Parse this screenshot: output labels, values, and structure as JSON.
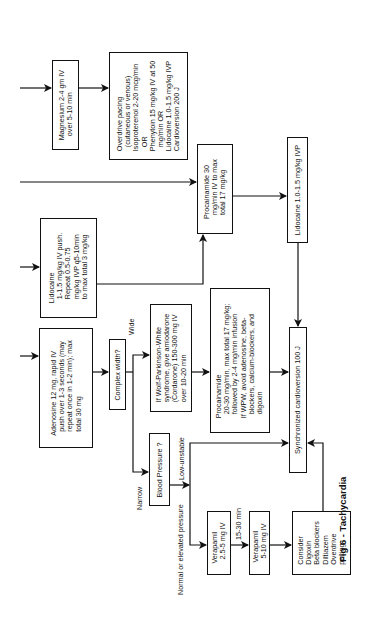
{
  "figure": {
    "caption": "Fig 6 - Tachycardia",
    "orientation": "rotated-90-ccw"
  },
  "nodes": {
    "magnesium": {
      "text": "Magnesium 2-4 gm IV\n  over 5-10 min"
    },
    "overdrive": {
      "text": "Overdrive pacing\n  (cutaneous or venous)\nIsoproterenol 2-20 mcg/min\n  OR\nPhenytoin 15 mg/kg IV at 50\n  mg/min OR\nLidocaine 1.0-1.5 mg/kg IVP\nCardioversion 200 J"
    },
    "procainamide30": {
      "text": "Procainamide 30\n  mg/min IV to max\n  total 17 mg/kg"
    },
    "lidocaine_ivp": {
      "text": "Lidocaine 1.0-1.5 mg/kg IVP"
    },
    "lidocaine_push": {
      "text": "Lidocaine\n  1-1.5 mg/kg IV push.\n  Repeat 0.5-0.75\n  mg/kg IVP q5-10min\n  to max total 3 mg/kg"
    },
    "adenosine": {
      "text": "Adenosine 12 mg, rapid IV\n  push over 1-3 seconds (may\n  repeat once in 1-2 min); max\n  total 30 mg"
    },
    "complex_width": {
      "text": "Complex width?"
    },
    "wpw": {
      "text": "If Wolf-Parkinson-White\nsyndrome, give amiodarone\n(Cordarone) 150-300 mg IV\nover 10-20 min"
    },
    "procainamide20": {
      "text": "Procainamide\n  20-30 mg/min, max total 17 mg/kg;\n  followed by 2-4 mg/min infusion\nIf WPW, avoid adenosine, beta-\n  blockers, calcium-blockers, and\n  digoxin"
    },
    "sync_cardioversion": {
      "text": "Synchronized cardioversion 100 J"
    },
    "blood_pressure": {
      "text": "Blood Pressure ?"
    },
    "verapamil1": {
      "text": "Verapamil\n  2.5-5 mg IV"
    },
    "verapamil2": {
      "text": "Verapamil\n  5-10 mg IV"
    },
    "consider": {
      "text": "Consider\nDigoxin\nBeta blockers\nDiltiazem\nOverdrive\npacing"
    }
  },
  "edge_labels": {
    "wide": "Wide",
    "narrow": "Narrow",
    "low_unstable": "Low-unstable",
    "normal_elevated": "Normal or elevated pressure",
    "interval": "15-30 min"
  }
}
